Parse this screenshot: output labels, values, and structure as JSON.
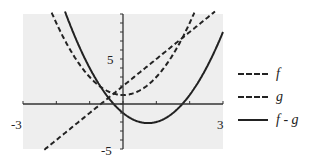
{
  "chart_data": {
    "type": "line",
    "title": "",
    "xlabel": "",
    "ylabel": "",
    "xlim": [
      -3,
      3
    ],
    "ylim": [
      -5,
      10
    ],
    "x_tick_labels": [
      "-3",
      "3"
    ],
    "y_tick_labels": [
      "5",
      "-5"
    ],
    "grid": false,
    "background": "#eeeeee",
    "legend_position": "right",
    "series": [
      {
        "name": "f",
        "style": "dashed",
        "formula": "3x+2",
        "x": [
          -2.3,
          -2,
          -1,
          0,
          1,
          2,
          2.67
        ],
        "values": [
          -4.9,
          -4,
          -1,
          2,
          5,
          8,
          10
        ]
      },
      {
        "name": "g",
        "style": "dashed",
        "formula": "2x^2+1",
        "x": [
          -2.12,
          -2,
          -1,
          0,
          1,
          2,
          2.12
        ],
        "values": [
          10,
          9,
          3,
          1,
          3,
          9,
          10
        ]
      },
      {
        "name": "f - g",
        "style": "solid",
        "formula": "2x^2-3x-1",
        "x": [
          -1.61,
          -1,
          0,
          0.75,
          1,
          2,
          3
        ],
        "values": [
          10,
          4,
          -1,
          -2.1,
          -2,
          1,
          8
        ]
      }
    ]
  },
  "legend": {
    "items": [
      {
        "label": "f",
        "style": "dashed"
      },
      {
        "label": "g",
        "style": "dashed"
      },
      {
        "label": "f - g",
        "style": "solid"
      }
    ]
  },
  "axis_labels": {
    "x_min": "-3",
    "x_max": "3",
    "y_pos": "5",
    "y_neg": "-5"
  }
}
